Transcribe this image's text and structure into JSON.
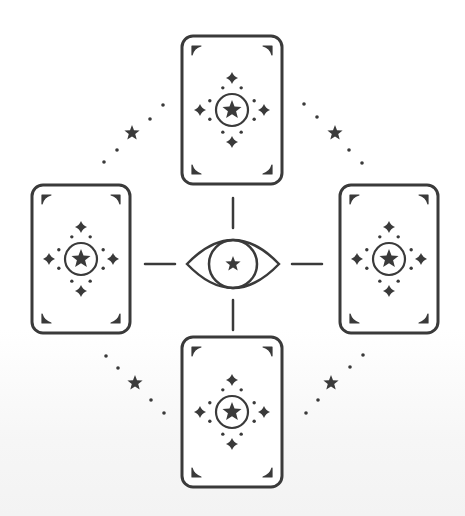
{
  "illustration": {
    "title": "Tarot spread with all-seeing eye",
    "colors": {
      "ink": "#3a3a3a",
      "background": "#ffffff"
    },
    "cards": [
      {
        "name": "card-top",
        "motif": "star-in-circle"
      },
      {
        "name": "card-left",
        "motif": "star-in-circle"
      },
      {
        "name": "card-right",
        "motif": "star-in-circle"
      },
      {
        "name": "card-bottom",
        "motif": "star-in-circle"
      }
    ],
    "center_symbol": "eye-with-star",
    "connectors": [
      "top",
      "left",
      "right",
      "bottom"
    ],
    "dotted_arcs": [
      "top-left",
      "top-right",
      "bottom-left",
      "bottom-right"
    ]
  }
}
